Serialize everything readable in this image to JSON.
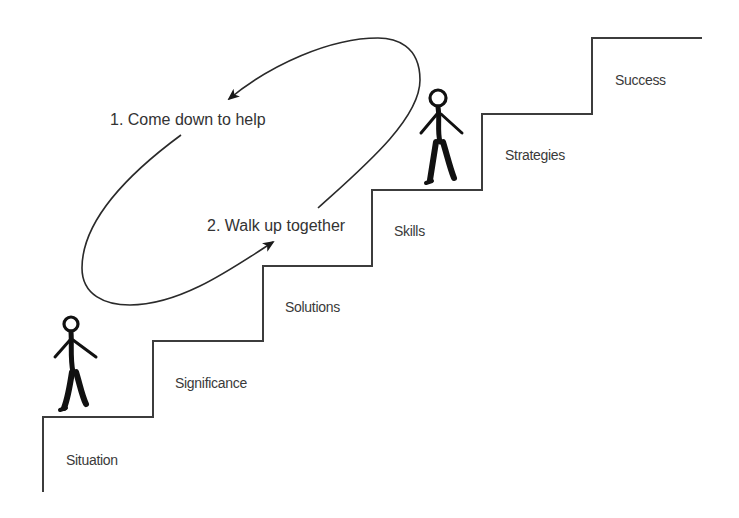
{
  "diagram": {
    "type": "staircase-process",
    "steps": [
      {
        "label": "Situation"
      },
      {
        "label": "Significance"
      },
      {
        "label": "Solutions"
      },
      {
        "label": "Skills"
      },
      {
        "label": "Strategies"
      },
      {
        "label": "Success"
      }
    ],
    "loop": {
      "top_arrow_label": "1. Come down to help",
      "bottom_arrow_label": "2. Walk up together"
    },
    "figures": [
      {
        "name": "helper",
        "position": "on Skills step"
      },
      {
        "name": "learner",
        "position": "on Situation step"
      }
    ],
    "colors": {
      "line": "#3c3c3c",
      "text": "#333333",
      "figure": "#111111",
      "background": "#ffffff"
    }
  }
}
